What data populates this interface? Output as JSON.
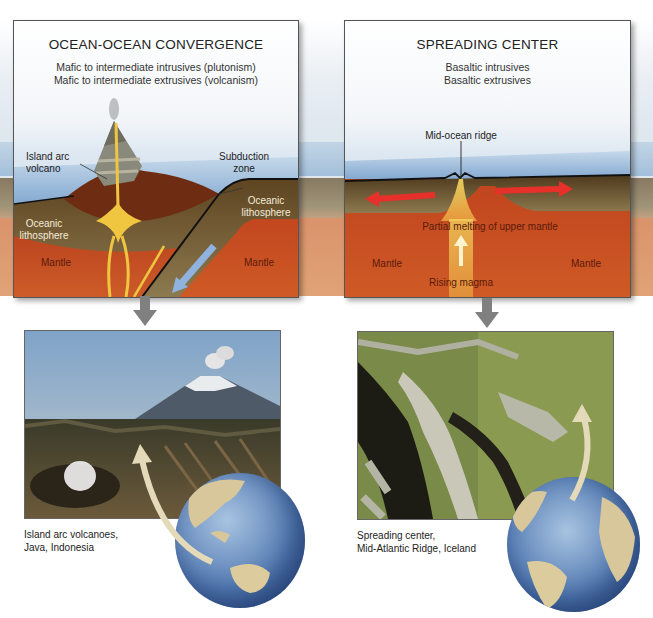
{
  "left_panel": {
    "title": "OCEAN-OCEAN CONVERGENCE",
    "subtitle_lines": [
      "Mafic to intermediate intrusives (plutonism)",
      "Mafic to intermediate extrusives (volcanism)"
    ],
    "labels": {
      "island_arc_volcano_1": "Island arc",
      "island_arc_volcano_2": "volcano",
      "subduction_zone_1": "Subduction",
      "subduction_zone_2": "zone",
      "oceanic_lithosphere_left_1": "Oceanic",
      "oceanic_lithosphere_left_2": "lithosphere",
      "oceanic_lithosphere_right_1": "Oceanic",
      "oceanic_lithosphere_right_2": "lithosphere",
      "mantle_left": "Mantle",
      "mantle_right": "Mantle"
    }
  },
  "right_panel": {
    "title": "SPREADING CENTER",
    "subtitle_lines": [
      "Basaltic intrusives",
      "Basaltic extrusives"
    ],
    "labels": {
      "mid_ocean_ridge": "Mid-ocean ridge",
      "partial_melting": "Partial melting of upper mantle",
      "mantle_left": "Mantle",
      "mantle_right": "Mantle",
      "rising_magma": "Rising magma"
    }
  },
  "left_photo": {
    "subject": "volcano-photo",
    "caption_lines": [
      "Island arc volcanoes,",
      "Java, Indonesia"
    ],
    "globe_region": "Indian Ocean / Indonesia"
  },
  "right_photo": {
    "subject": "rift-photo",
    "caption_lines": [
      "Spreading center,",
      "Mid-Atlantic Ridge, Iceland"
    ],
    "globe_region": "Atlantic Ocean"
  },
  "colors": {
    "water": "#9dbbd9",
    "lithosphere": "#6b5433",
    "mantle": "#c9502a",
    "magma": "#f0c640",
    "spreading_arrow": "#e8302a",
    "subduction_arrow": "#8fb3de",
    "down_arrow": "#808080",
    "pointer_arrow": "#e4d9b8"
  }
}
